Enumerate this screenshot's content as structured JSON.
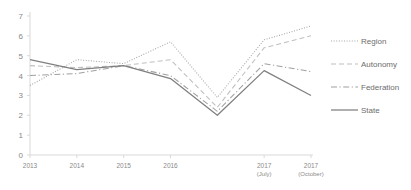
{
  "chart_data": {
    "type": "line",
    "title": "",
    "subtitle": "",
    "xlabel": "",
    "ylabel": "",
    "grid": false,
    "legend_position": "right",
    "ylim": [
      0,
      7
    ],
    "yticks": [
      0,
      1,
      2,
      3,
      4,
      5,
      6,
      7
    ],
    "ytick_labels": [
      "0",
      "1",
      "2",
      "3",
      "4",
      "5",
      "6",
      "7"
    ],
    "categories": [
      "2013",
      "2014",
      "2015",
      "2016",
      "",
      "2017 (July)",
      "2017 (October)"
    ],
    "xtick_labels": [
      {
        "main": "2013",
        "sub": ""
      },
      {
        "main": "2014",
        "sub": ""
      },
      {
        "main": "2015",
        "sub": ""
      },
      {
        "main": "2016",
        "sub": ""
      },
      {
        "main": "2017",
        "sub": "(July)"
      },
      {
        "main": "2017",
        "sub": "(October)"
      }
    ],
    "series": [
      {
        "name": "Region",
        "style": "dotted",
        "color": "#a6a6a6",
        "values": [
          3.5,
          4.8,
          4.6,
          5.7,
          2.9,
          5.8,
          6.5
        ]
      },
      {
        "name": "Autonomy",
        "style": "dashed",
        "color": "#bfbfbf",
        "values": [
          4.5,
          4.4,
          4.5,
          4.8,
          2.4,
          5.4,
          6.0
        ]
      },
      {
        "name": "Federation",
        "style": "dashdot",
        "color": "#a0a0a0",
        "values": [
          4.0,
          4.1,
          4.5,
          4.0,
          2.2,
          4.6,
          4.2
        ]
      },
      {
        "name": "State",
        "style": "solid",
        "color": "#7f7f7f",
        "values": [
          4.8,
          4.3,
          4.5,
          3.85,
          2.0,
          4.25,
          3.0
        ]
      }
    ]
  },
  "legend": {
    "items": [
      {
        "label": "Region"
      },
      {
        "label": "Autonomy"
      },
      {
        "label": "Federation"
      },
      {
        "label": "State"
      }
    ]
  }
}
